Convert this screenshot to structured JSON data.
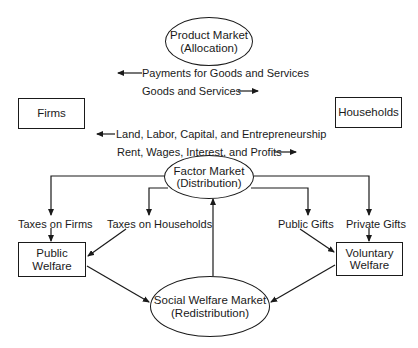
{
  "nodes": {
    "product_market": {
      "line1": "Product Market",
      "line2": "(Allocation)"
    },
    "firms": {
      "label": "Firms"
    },
    "households": {
      "label": "Households"
    },
    "factor_market": {
      "line1": "Factor Market",
      "line2": "(Distribution)"
    },
    "public_welfare": {
      "line1": "Public",
      "line2": "Welfare"
    },
    "voluntary_welfare": {
      "line1": "Voluntary",
      "line2": "Welfare"
    },
    "social_welfare_market": {
      "line1": "Social Welfare Market",
      "line2": "(Redistribution)"
    }
  },
  "flows": {
    "payments_goods_services": {
      "label": "Payments for Goods and Services",
      "direction": "left"
    },
    "goods_services": {
      "label": "Goods and Services",
      "direction": "right"
    },
    "land_labor": {
      "label": "Land, Labor, Capital, and Entrepreneurship",
      "direction": "left"
    },
    "rent_wages": {
      "label": "Rent, Wages, Interest, and Profits",
      "direction": "right"
    },
    "taxes_on_firms": {
      "label": "Taxes on Firms"
    },
    "taxes_on_households": {
      "label": "Taxes on Households"
    },
    "public_gifts": {
      "label": "Public Gifts"
    },
    "private_gifts": {
      "label": "Private Gifts"
    }
  },
  "colors": {
    "ink": "#1a1a1a",
    "background": "#ffffff"
  }
}
